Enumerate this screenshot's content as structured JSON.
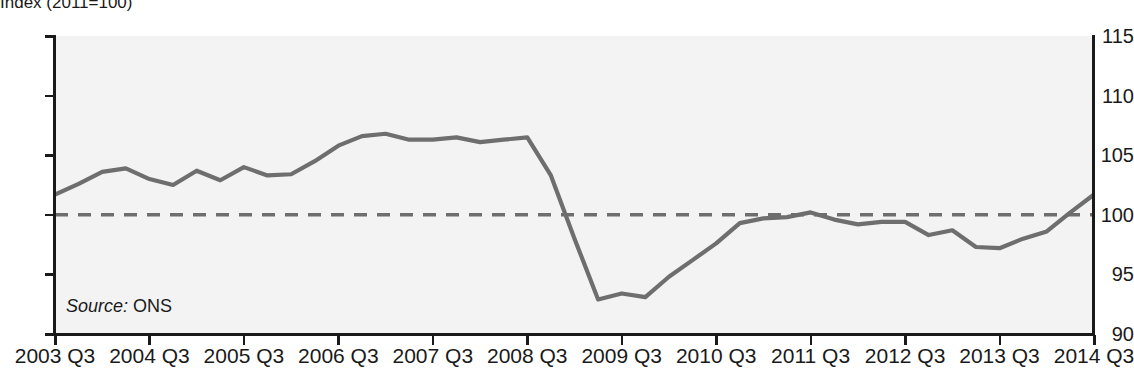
{
  "chart_data": {
    "type": "line",
    "title": "Index (2011=100)",
    "xlabel": "",
    "ylabel": "",
    "ylim": [
      90,
      115
    ],
    "ytick_values": [
      115,
      110,
      105,
      100,
      95,
      90
    ],
    "ytick_labels": [
      "115",
      "110",
      "105",
      "100",
      "95",
      "90"
    ],
    "xtick_labels": [
      "2003 Q3",
      "2004 Q3",
      "2005 Q3",
      "2006 Q3",
      "2007 Q3",
      "2008 Q3",
      "2009 Q3",
      "2010 Q3",
      "2011 Q3",
      "2012 Q3",
      "2013 Q3",
      "2014 Q3"
    ],
    "grid": false,
    "legend": null,
    "source_label": "Source:",
    "source_value": "ONS",
    "line_color": "#6e6e6e",
    "reference_line_color": "#6e6e6e",
    "plot_background": "#f3f3f3",
    "axis_color": "#1a1a1a",
    "reference_line": {
      "value": 100,
      "style": "dashed",
      "label": "100 (2011 base)"
    },
    "x": [
      "2003 Q3",
      "2003 Q4",
      "2004 Q1",
      "2004 Q2",
      "2004 Q3",
      "2004 Q4",
      "2005 Q1",
      "2005 Q2",
      "2005 Q3",
      "2005 Q4",
      "2006 Q1",
      "2006 Q2",
      "2006 Q3",
      "2006 Q4",
      "2007 Q1",
      "2007 Q2",
      "2007 Q3",
      "2007 Q4",
      "2008 Q1",
      "2008 Q2",
      "2008 Q3",
      "2008 Q4",
      "2009 Q1",
      "2009 Q2",
      "2009 Q3",
      "2009 Q4",
      "2010 Q1",
      "2010 Q2",
      "2010 Q3",
      "2010 Q4",
      "2011 Q1",
      "2011 Q2",
      "2011 Q3",
      "2011 Q4",
      "2012 Q1",
      "2012 Q2",
      "2012 Q3",
      "2012 Q4",
      "2013 Q1",
      "2013 Q2",
      "2013 Q3",
      "2013 Q4",
      "2014 Q1",
      "2014 Q2",
      "2014 Q3"
    ],
    "values": [
      101.7,
      102.6,
      103.6,
      103.9,
      103.0,
      102.5,
      103.7,
      102.9,
      104.0,
      103.3,
      103.4,
      104.5,
      105.8,
      106.6,
      106.8,
      106.3,
      106.3,
      106.5,
      106.1,
      106.3,
      106.5,
      103.3,
      98.0,
      92.9,
      93.4,
      93.1,
      94.8,
      96.2,
      97.6,
      99.3,
      99.7,
      99.8,
      100.2,
      99.6,
      99.2,
      99.4,
      99.4,
      98.3,
      98.7,
      97.3,
      97.2,
      98.0,
      98.6,
      100.2,
      101.7
    ]
  }
}
